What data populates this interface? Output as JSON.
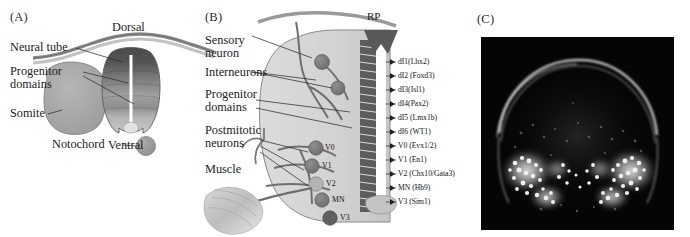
{
  "figure": {
    "kind": "scientific-figure",
    "background": "#ffffff",
    "panels": [
      {
        "id": "A",
        "label": "(A)"
      },
      {
        "id": "B",
        "label": "(B)"
      },
      {
        "id": "C",
        "label": "(C)"
      }
    ]
  },
  "panelA": {
    "label": "(A)",
    "annotations": {
      "dorsal": "Dorsal",
      "ventral": "Ventral",
      "neural_tube": "Neural tube",
      "progenitor_domains_line1": "Progenitor",
      "progenitor_domains_line2": "domains",
      "somite": "Somite",
      "notochord": "Notochord"
    },
    "colors": {
      "ectoderm": "#b9b9b9",
      "tube_dorsal": "#4f4f4f",
      "tube_mid": "#8c8c8c",
      "tube_ventral": "#c3c3c3",
      "somite": "#a8a8a8",
      "notochord": "#9e9e9e",
      "lumen": "#ffffff",
      "outline": "#6e6e6e"
    }
  },
  "panelB": {
    "label": "(B)",
    "roof_plate": "RP",
    "left_labels": [
      {
        "name": "sensory-neuron",
        "line1": "Sensory",
        "line2": "neuron"
      },
      {
        "name": "interneurons",
        "line1": "Interneurons",
        "line2": ""
      },
      {
        "name": "progenitor-domains",
        "line1": "Progenitor",
        "line2": "domains"
      },
      {
        "name": "postmitotic-neurons",
        "line1": "Postmitotic",
        "line2": "neurons"
      },
      {
        "name": "muscle",
        "line1": "Muscle",
        "line2": ""
      }
    ],
    "interior_labels": [
      "V0",
      "V1",
      "V2",
      "MN",
      "V3"
    ],
    "domain_labels": [
      {
        "domain": "dI1",
        "gene": "(Lhx2)",
        "text": "dI1(Lhx2)"
      },
      {
        "domain": "dI2",
        "gene": "(Foxd3)",
        "text": "dI2 (Foxd3)"
      },
      {
        "domain": "dI3",
        "gene": "(Isl1)",
        "text": "dI3(Isl1)"
      },
      {
        "domain": "dI4",
        "gene": "(Pax2)",
        "text": "dI4(Pax2)"
      },
      {
        "domain": "dI5",
        "gene": "(Lmx1b)",
        "text": "dI5 (Lmx1b)"
      },
      {
        "domain": "dI6",
        "gene": "(WT1)",
        "text": "dI6 (WT1)"
      },
      {
        "domain": "V0",
        "gene": "(Evx1/2)",
        "text": "V0 (Evx1/2)"
      },
      {
        "domain": "V1",
        "gene": "(En1)",
        "text": "V1 (En1)"
      },
      {
        "domain": "V2",
        "gene": "(Chx10/Gata3)",
        "text": "V2 (Chx10/Gata3)"
      },
      {
        "domain": "MN",
        "gene": "(Hb9)",
        "text": "MN (Hb9)"
      },
      {
        "domain": "V3",
        "gene": "(Sim1)",
        "text": "V3 (Sim1)"
      }
    ],
    "colors": {
      "tube_fill": "#d6d6d6",
      "progenitor_stripe_dark": "#3a3a3a",
      "roof_plate": "#5a5a5a",
      "neuron_body": "#7a7a7a",
      "axon": "#6b6b6b",
      "muscle": "#c9c9c9",
      "lumen": "#ffffff"
    }
  },
  "panelC": {
    "label": "(C)",
    "image": {
      "type": "fluorescence-micrograph",
      "background": "#050505",
      "signal_color": "#e8e8e8",
      "description": "transverse spinal cord section with bilateral bright motor neuron clusters"
    }
  }
}
